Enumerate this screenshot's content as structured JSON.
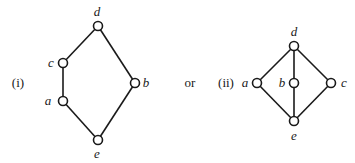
{
  "diagrams": [
    {
      "caption": "(i)",
      "caption_pos": [
        18,
        87
      ],
      "nodes": [
        {
          "id": "d",
          "label": "d",
          "x": 98,
          "y": 26,
          "lx": 97,
          "ly": 16
        },
        {
          "id": "c",
          "label": "c",
          "x": 63,
          "y": 63,
          "lx": 51,
          "ly": 67
        },
        {
          "id": "a",
          "label": "a",
          "x": 63,
          "y": 101,
          "lx": 48,
          "ly": 105
        },
        {
          "id": "e",
          "label": "e",
          "x": 98,
          "y": 140,
          "lx": 97,
          "ly": 158
        },
        {
          "id": "b",
          "label": "b",
          "x": 135,
          "y": 83,
          "lx": 146,
          "ly": 87
        }
      ],
      "edges": [
        [
          "d",
          "c"
        ],
        [
          "c",
          "a"
        ],
        [
          "a",
          "e"
        ],
        [
          "e",
          "b"
        ],
        [
          "b",
          "d"
        ]
      ]
    },
    {
      "caption": "(ii)",
      "caption_pos": [
        226,
        87
      ],
      "nodes": [
        {
          "id": "d",
          "label": "d",
          "x": 294,
          "y": 46,
          "lx": 294,
          "ly": 36
        },
        {
          "id": "a",
          "label": "a",
          "x": 257,
          "y": 83,
          "lx": 245,
          "ly": 87
        },
        {
          "id": "b",
          "label": "b",
          "x": 294,
          "y": 83,
          "lx": 282,
          "ly": 87
        },
        {
          "id": "c",
          "label": "c",
          "x": 331,
          "y": 83,
          "lx": 344,
          "ly": 87
        },
        {
          "id": "e",
          "label": "e",
          "x": 294,
          "y": 121,
          "lx": 294,
          "ly": 140
        }
      ],
      "edges": [
        [
          "d",
          "a"
        ],
        [
          "d",
          "b"
        ],
        [
          "d",
          "c"
        ],
        [
          "a",
          "e"
        ],
        [
          "b",
          "e"
        ],
        [
          "c",
          "e"
        ]
      ]
    }
  ],
  "connector": {
    "text": "or",
    "pos": [
      190,
      87
    ]
  }
}
